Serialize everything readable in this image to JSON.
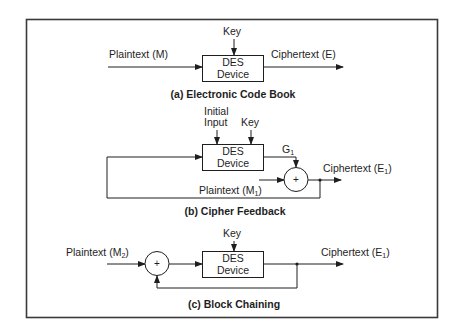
{
  "colors": {
    "ink": "#1e1e1e",
    "frame": "#3a3a3a",
    "background": "#ffffff"
  },
  "sections": {
    "ecb": {
      "caption": "(a) Electronic Code Book",
      "input_label": "Plaintext (M)",
      "output_label": "Ciphertext (E)",
      "key_label": "Key",
      "box_line1": "DES",
      "box_line2": "Device"
    },
    "cfb": {
      "caption": "(b) Cipher Feedback",
      "initial_label_line1": "Initial",
      "initial_label_line2": "Input",
      "key_label": "Key",
      "box_line1": "DES",
      "box_line2": "Device",
      "g_label": "G",
      "g_sub": "1",
      "plaintext_label": "Plaintext (M",
      "plaintext_sub": "1",
      "plaintext_close": ")",
      "output_label": "Ciphertext (E",
      "output_sub": "1",
      "output_close": ")",
      "xor_symbol": "+"
    },
    "cbc": {
      "caption": "(c) Block Chaining",
      "input_label": "Plaintext (M",
      "input_sub": "2",
      "input_close": ")",
      "key_label": "Key",
      "box_line1": "DES",
      "box_line2": "Device",
      "output_label": "Ciphertext (E",
      "output_sub": "1",
      "output_close": ")",
      "xor_symbol": "+"
    }
  }
}
